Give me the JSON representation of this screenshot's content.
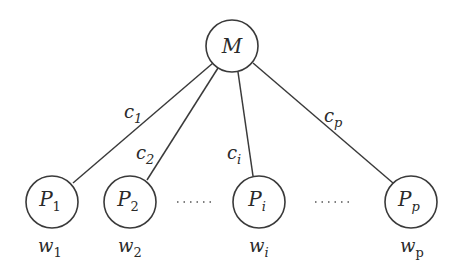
{
  "diagram": {
    "type": "star-tree",
    "root": {
      "id": "M",
      "label": "M",
      "cx": 232,
      "cy": 46,
      "r": 26
    },
    "children": [
      {
        "id": "P1",
        "label": "P",
        "sub": "1",
        "cx": 52,
        "cy": 202,
        "r": 26,
        "weight": "w",
        "weight_sub": "1",
        "edge_label": "c",
        "edge_sub": "1",
        "edge": {
          "x1": 213,
          "y1": 63,
          "x2": 73,
          "y2": 183
        },
        "edge_label_pos": {
          "x": 124,
          "y": 118
        },
        "weight_pos": {
          "x": 38,
          "y": 252
        }
      },
      {
        "id": "P2",
        "label": "P",
        "sub": "2",
        "cx": 130,
        "cy": 202,
        "r": 26,
        "weight": "w",
        "weight_sub": "2",
        "edge_label": "c",
        "edge_sub": "2",
        "edge": {
          "x1": 218,
          "y1": 68,
          "x2": 147,
          "y2": 180
        },
        "edge_label_pos": {
          "x": 136,
          "y": 159
        },
        "weight_pos": {
          "x": 118,
          "y": 252
        }
      },
      {
        "id": "Pi",
        "label": "P",
        "sub": "i",
        "cx": 259,
        "cy": 202,
        "r": 26,
        "weight": "w",
        "weight_sub": "i",
        "edge_label": "c",
        "edge_sub": "i",
        "edge": {
          "x1": 238,
          "y1": 72,
          "x2": 253,
          "y2": 176
        },
        "edge_label_pos": {
          "x": 227,
          "y": 159
        },
        "weight_pos": {
          "x": 249,
          "y": 252
        }
      },
      {
        "id": "Pp",
        "label": "P",
        "sub": "p",
        "cx": 411,
        "cy": 202,
        "r": 26,
        "weight": "w",
        "weight_sub": "p",
        "weight_sub_upright": true,
        "edge_label": "c",
        "edge_sub": "p",
        "edge": {
          "x1": 253,
          "y1": 63,
          "x2": 393,
          "y2": 183
        },
        "edge_label_pos": {
          "x": 324,
          "y": 122
        },
        "weight_pos": {
          "x": 400,
          "y": 252
        }
      }
    ],
    "ellipses": [
      {
        "x1": 177,
        "x2": 212,
        "y": 202,
        "text": "······"
      },
      {
        "x1": 315,
        "x2": 350,
        "y": 202,
        "text": "······"
      }
    ]
  }
}
